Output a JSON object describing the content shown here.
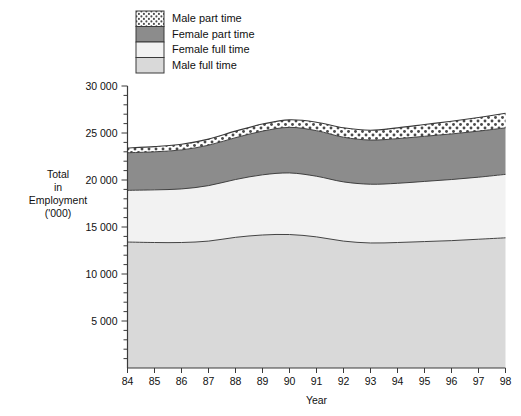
{
  "chart_data": {
    "type": "area",
    "title": "",
    "subtitle": "",
    "xlabel": "Year",
    "ylabel": "Total in Employment ('000)",
    "ylabel_lines": [
      "Total",
      "in",
      "Employment",
      "('000)"
    ],
    "categories": [
      "84",
      "85",
      "86",
      "87",
      "88",
      "89",
      "90",
      "91",
      "92",
      "93",
      "94",
      "95",
      "96",
      "97",
      "98"
    ],
    "x": [
      1984,
      1985,
      1986,
      1987,
      1988,
      1989,
      1990,
      1991,
      1992,
      1993,
      1994,
      1995,
      1996,
      1997,
      1998
    ],
    "xlim": [
      1984,
      1998
    ],
    "ylim": [
      0,
      30000
    ],
    "ytick_values": [
      5000,
      10000,
      15000,
      20000,
      25000,
      30000
    ],
    "ytick_labels": [
      "5 000",
      "10 000",
      "15 000",
      "20 000",
      "25 000",
      "30 000"
    ],
    "yminor_step": 1000,
    "grid": false,
    "legend_position": "top-left",
    "stacked": true,
    "stack_order_bottom_to_top": [
      "Male full time",
      "Female full time",
      "Female part time",
      "Male part time"
    ],
    "series": [
      {
        "name": "Male full time",
        "fill": "#d9d9d9",
        "pattern": "solid",
        "values": [
          13400,
          13350,
          13350,
          13500,
          13900,
          14150,
          14200,
          13950,
          13500,
          13300,
          13350,
          13450,
          13550,
          13700,
          13850
        ]
      },
      {
        "name": "Female full time",
        "fill": "#f2f2f2",
        "pattern": "solid",
        "values": [
          5500,
          5600,
          5700,
          5900,
          6150,
          6400,
          6550,
          6450,
          6300,
          6250,
          6300,
          6400,
          6500,
          6600,
          6750
        ]
      },
      {
        "name": "Female part time",
        "fill": "#8c8c8c",
        "pattern": "solid",
        "values": [
          4000,
          4050,
          4150,
          4300,
          4450,
          4650,
          4850,
          4850,
          4750,
          4700,
          4750,
          4800,
          4850,
          4900,
          4950
        ]
      },
      {
        "name": "Male part time",
        "fill": "#ffffff",
        "pattern": "dots",
        "values": [
          500,
          550,
          600,
          650,
          700,
          750,
          800,
          900,
          1000,
          1050,
          1150,
          1250,
          1350,
          1450,
          1550
        ]
      }
    ],
    "totals": [
      23400,
      23550,
      23800,
      24350,
      25200,
      25950,
      26400,
      26150,
      25550,
      25300,
      25550,
      25900,
      26250,
      26650,
      27100
    ]
  },
  "legend": {
    "entries": [
      {
        "label": "Male part time",
        "swatch": "dots",
        "color": "#ffffff"
      },
      {
        "label": "Female part time",
        "swatch": "solid",
        "color": "#8c8c8c"
      },
      {
        "label": "Female full time",
        "swatch": "solid",
        "color": "#f2f2f2"
      },
      {
        "label": "Male full time",
        "swatch": "solid",
        "color": "#d9d9d9"
      }
    ]
  },
  "colors": {
    "axis": "#3a3a3a",
    "text": "#111111",
    "male_full_time": "#d9d9d9",
    "female_full_time": "#f2f2f2",
    "female_part_time": "#8c8c8c",
    "male_part_time": "#ffffff"
  }
}
